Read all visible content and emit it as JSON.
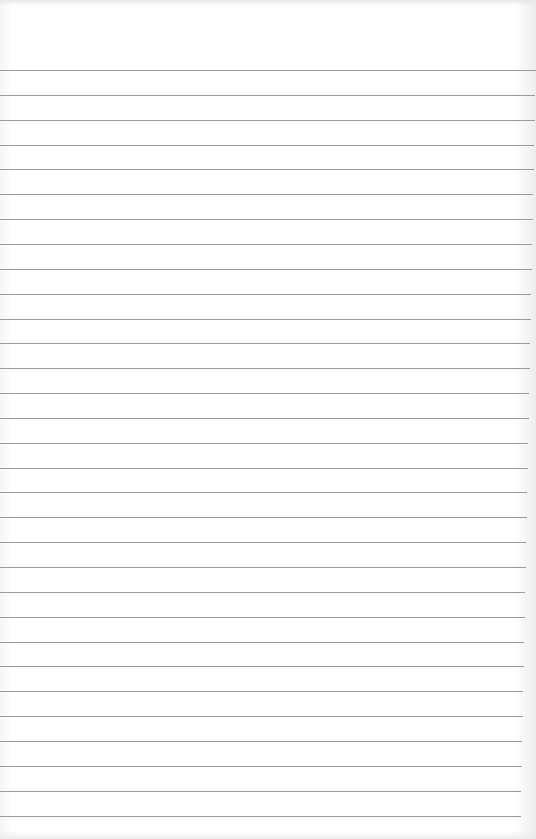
{
  "page": {
    "type": "lined-paper",
    "background_color": "#ffffff",
    "line_color": "#9a9a9a",
    "line_count": 31,
    "first_line_y": 70,
    "line_spacing": 24.85
  }
}
